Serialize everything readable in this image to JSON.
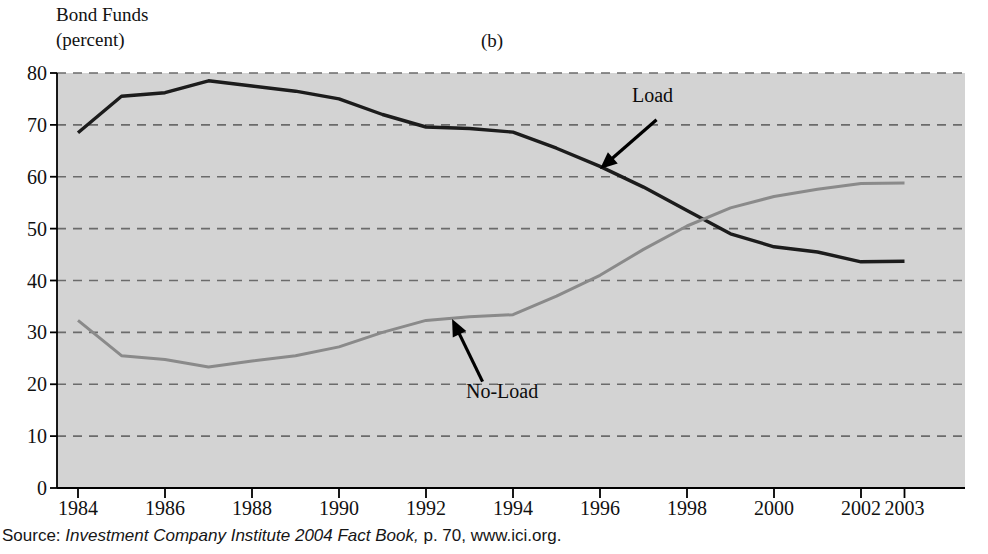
{
  "figure": {
    "axis_title": "Bond Funds",
    "axis_unit": "(percent)",
    "panel_label": "(b)",
    "source_prefix": "Source: ",
    "source_title": "Investment Company Institute 2004 Fact Book,",
    "source_suffix": " p. 70, www.ici.org."
  },
  "annotations": {
    "load": "Load",
    "no_load": "No-Load"
  },
  "colors": {
    "plot_background": "#d3d3d3",
    "gridline": "#6b6b6b",
    "axis": "#000000",
    "load_series": "#1c1c1c",
    "no_load_series": "#8a8a8a",
    "page_background": "#ffffff"
  },
  "chart_data": {
    "type": "line",
    "title": "Bond Funds",
    "subtitle": "(b)",
    "xlabel": "",
    "ylabel": "Bond Funds (percent)",
    "ylim": [
      0,
      80
    ],
    "xlim": [
      1984,
      2003
    ],
    "grid": true,
    "legend_position": "inline-annotations",
    "yticks": [
      0,
      10,
      20,
      30,
      40,
      50,
      60,
      70,
      80
    ],
    "ytick_labels": [
      "0",
      "10",
      "20",
      "30",
      "40",
      "50",
      "60",
      "70",
      "80"
    ],
    "xticks": [
      1984,
      1986,
      1988,
      1990,
      1992,
      1994,
      1996,
      1998,
      2000,
      2002,
      2003
    ],
    "xtick_labels": [
      "1984",
      "1986",
      "1988",
      "1990",
      "1992",
      "1994",
      "1996",
      "1998",
      "2000",
      "2002",
      "2003"
    ],
    "x": [
      1984,
      1985,
      1986,
      1987,
      1988,
      1989,
      1990,
      1991,
      1992,
      1993,
      1994,
      1995,
      1996,
      1997,
      1998,
      1999,
      2000,
      2001,
      2002,
      2003
    ],
    "series": [
      {
        "name": "Load",
        "color": "#1c1c1c",
        "values": [
          68.5,
          75.5,
          76.2,
          78.5,
          77.5,
          76.5,
          75.0,
          72.0,
          69.6,
          69.3,
          68.6,
          65.5,
          62.0,
          58.0,
          53.5,
          49.0,
          46.5,
          45.5,
          43.6,
          43.7
        ]
      },
      {
        "name": "No-Load",
        "color": "#8a8a8a",
        "values": [
          32.3,
          25.5,
          24.8,
          23.3,
          24.5,
          25.5,
          27.2,
          30.0,
          32.3,
          33.0,
          33.4,
          37.0,
          41.0,
          46.0,
          50.5,
          54.0,
          56.2,
          57.6,
          58.7,
          58.8
        ]
      }
    ],
    "annotations": [
      {
        "text": "Load",
        "point_x": 1996.0,
        "point_y": 61.5,
        "label_x": 1997.3,
        "label_y": 71.0
      },
      {
        "text": "No-Load",
        "point_x": 1992.6,
        "point_y": 32.6,
        "label_x": 1993.3,
        "label_y": 20.5
      }
    ]
  }
}
